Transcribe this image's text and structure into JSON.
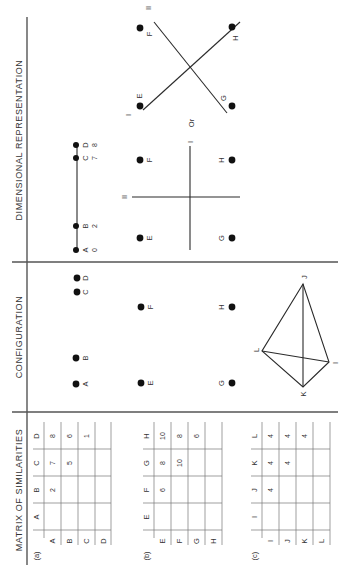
{
  "columns": {
    "matrix": "MATRIX OF SIMILARITIES",
    "configuration": "CONFIGURATION",
    "dimensional": "DIMENSIONAL  REPRESENTATION"
  },
  "rows": [
    {
      "label": "(a)",
      "items": [
        "A",
        "B",
        "C",
        "D"
      ],
      "matrix": [
        [
          "",
          "2",
          "7",
          "8"
        ],
        [
          "",
          "",
          "5",
          "6"
        ],
        [
          "",
          "",
          "",
          "1"
        ],
        [
          "",
          "",
          "",
          ""
        ]
      ],
      "dimension": {
        "type": "one-dimensional",
        "points": [
          {
            "label": "A",
            "value": "0"
          },
          {
            "label": "B",
            "value": "2"
          },
          {
            "label": "C",
            "value": "7"
          },
          {
            "label": "D",
            "value": "8"
          }
        ]
      }
    },
    {
      "label": "(b)",
      "items": [
        "E",
        "F",
        "G",
        "H"
      ],
      "matrix": [
        [
          "",
          "6",
          "8",
          "10"
        ],
        [
          "",
          "",
          "10",
          "8"
        ],
        [
          "",
          "",
          "",
          "6"
        ],
        [
          "",
          "",
          "",
          ""
        ]
      ],
      "dimension": {
        "type": "two-dimensional",
        "axis1": "I",
        "axis2": "II",
        "separator": "Or",
        "points": [
          "E",
          "F",
          "G",
          "H"
        ]
      }
    },
    {
      "label": "(c)",
      "items": [
        "I",
        "J",
        "K",
        "L"
      ],
      "matrix": [
        [
          "",
          "4",
          "4",
          "4"
        ],
        [
          "",
          "",
          "4",
          "4"
        ],
        [
          "",
          "",
          "",
          "4"
        ],
        [
          "",
          "",
          "",
          ""
        ]
      ],
      "configuration": {
        "shape": "tetrahedron",
        "vertices": [
          "I",
          "J",
          "K",
          "L"
        ]
      }
    }
  ],
  "labels": {
    "axis_I": "I",
    "axis_II": "II",
    "or": "Or"
  }
}
